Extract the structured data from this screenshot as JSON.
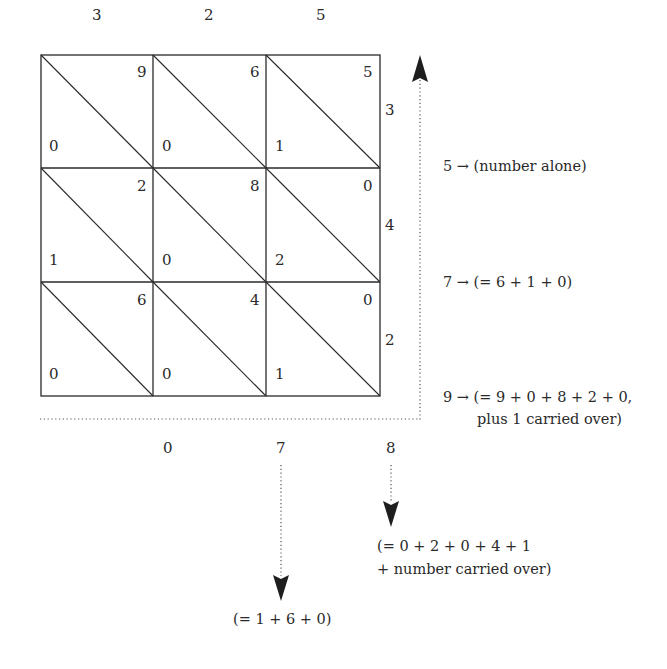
{
  "multiplicand": {
    "digits": [
      "3",
      "2",
      "5"
    ]
  },
  "multiplier": {
    "digits": [
      "3",
      "4",
      "2"
    ]
  },
  "grid": {
    "rows": [
      [
        {
          "tens": "0",
          "units": "9"
        },
        {
          "tens": "0",
          "units": "6"
        },
        {
          "tens": "1",
          "units": "5"
        }
      ],
      [
        {
          "tens": "1",
          "units": "2"
        },
        {
          "tens": "0",
          "units": "8"
        },
        {
          "tens": "2",
          "units": "0"
        }
      ],
      [
        {
          "tens": "0",
          "units": "6"
        },
        {
          "tens": "0",
          "units": "4"
        },
        {
          "tens": "1",
          "units": "0"
        }
      ]
    ]
  },
  "result_bottom": {
    "digits": [
      "0",
      "7",
      "8"
    ]
  },
  "right_annotations": [
    {
      "digit": "5",
      "arrow": "→",
      "text": "(number alone)"
    },
    {
      "digit": "7",
      "arrow": "→",
      "text": "(= 6 + 1 + 0)"
    },
    {
      "digit": "9",
      "arrow": "→",
      "text": "(= 9 + 0 + 8 + 2 + 0,",
      "text2": "plus 1 carried over)"
    }
  ],
  "bottom_annotations": [
    {
      "for_digit": "8",
      "line1": "(= 0 + 2 + 0 + 4 + 1",
      "line2": "+ number carried over)"
    },
    {
      "for_digit": "7",
      "line1": "(= 1 + 6 + 0)"
    }
  ],
  "colors": {
    "line": "#2a2a2a",
    "dotted": "#555555",
    "text": "#2a2a2a"
  }
}
